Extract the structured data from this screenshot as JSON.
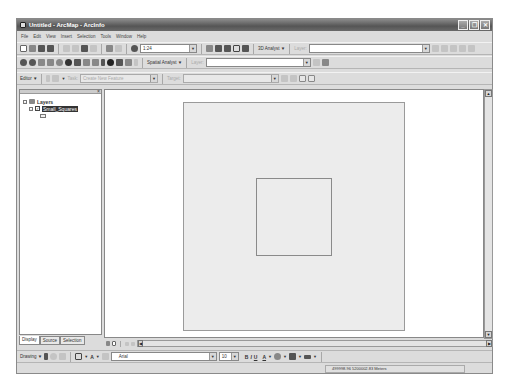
{
  "window": {
    "title": "Untitled - ArcMap - ArcInfo",
    "controls": {
      "minimize": "_",
      "restore": "❐",
      "close": "✕"
    }
  },
  "menu": {
    "items": [
      "File",
      "Edit",
      "View",
      "Insert",
      "Selection",
      "Tools",
      "Window",
      "Help"
    ]
  },
  "standard_toolbar": {
    "icons": [
      "new-icon",
      "open-icon",
      "save-icon",
      "print-icon",
      "cut-icon",
      "copy-icon",
      "paste-icon",
      "delete-icon",
      "undo-icon",
      "redo-icon",
      "add-data-icon"
    ],
    "scale_value": "1:24",
    "tools": [
      "editor-toolbar-icon",
      "arctoolbox-icon",
      "arccatalog-icon",
      "command-line-icon",
      "whats-this-icon"
    ],
    "analyst_label": "3D Analyst",
    "layer_label": "Layer:",
    "layer_value": ""
  },
  "tools_toolbar": {
    "icons": [
      "zoom-in-icon",
      "zoom-out-icon",
      "fixed-zoom-in-icon",
      "fixed-zoom-out-icon",
      "pan-icon",
      "full-extent-icon",
      "back-icon",
      "forward-icon",
      "select-features-icon",
      "select-elements-icon",
      "identify-icon",
      "find-icon",
      "measure-icon",
      "hyperlink-icon"
    ],
    "spatial_analyst_label": "Spatial Analyst",
    "layer_label": "Layer:",
    "layer_value": ""
  },
  "editor_toolbar": {
    "editor_label": "Editor",
    "task_label": "Task:",
    "task_value": "Create New Feature",
    "target_label": "Target:",
    "target_value": ""
  },
  "toc": {
    "root_label": "Layers",
    "layers": [
      {
        "name": "Small_Squares",
        "checked": true,
        "selected": true
      }
    ],
    "tabs": [
      "Display",
      "Source",
      "Selection"
    ],
    "active_tab": "Display"
  },
  "map": {
    "background": "#ffffff",
    "outer_polygon_fill": "#ececec",
    "inner_polygon_fill": "none"
  },
  "drawing_toolbar": {
    "drawing_label": "Drawing",
    "font_value": "Arial",
    "font_size": "10",
    "bold": "B",
    "italic": "I",
    "underline": "U",
    "font_color": "A"
  },
  "status": {
    "coordinates": "499998.96  5200002.83 Meters"
  }
}
